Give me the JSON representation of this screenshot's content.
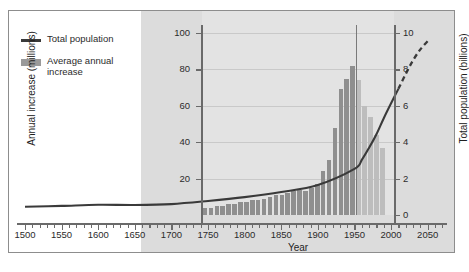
{
  "chart_data": {
    "type": "bar",
    "title": "",
    "xlabel": "Year",
    "ylabel": "Annual increase (millions)",
    "y2label": "Total population (billions)",
    "xlim": [
      1500,
      2075
    ],
    "ylim": [
      0,
      100
    ],
    "y2lim": [
      0,
      10
    ],
    "grid": true,
    "legend_position": "top-left",
    "legend": [
      {
        "label": "Total population",
        "marker": "line",
        "color": "#3a3a3a"
      },
      {
        "label": "Average annual\nincrease",
        "marker": "bar",
        "color": "#9a9a9a"
      }
    ],
    "xticks": [
      1500,
      1550,
      1600,
      1650,
      1700,
      1750,
      1800,
      1850,
      1900,
      1950,
      2000,
      2050
    ],
    "xticks_minor_step": 10,
    "yticks_left": [
      20,
      40,
      60,
      80,
      100
    ],
    "yticks_right": [
      0,
      2,
      4,
      6,
      8,
      10
    ],
    "annotations": [
      {
        "type": "vline",
        "x": 2010,
        "label": "present-day divider",
        "color": "#7a7a7a"
      },
      {
        "type": "shaded-region",
        "x_start": 1677,
        "x_end": 2075,
        "color": "#dcdcdc"
      },
      {
        "type": "dashed-line-segment",
        "x_start": 2010,
        "x_end": 2050,
        "label": "projected total population"
      }
    ],
    "series": [
      {
        "name": "Average annual increase",
        "type": "bar",
        "unit": "millions",
        "axis": "left",
        "bar_width_years": 10,
        "x": [
          1750,
          1760,
          1770,
          1780,
          1790,
          1800,
          1810,
          1820,
          1830,
          1840,
          1850,
          1860,
          1870,
          1880,
          1890,
          1900,
          1910,
          1920,
          1930,
          1940,
          1950,
          1960,
          1970,
          1980,
          1990,
          2000,
          2010,
          2020,
          2030,
          2040,
          2050
        ],
        "values": [
          4,
          4,
          5,
          5,
          6,
          6,
          7,
          7,
          8,
          8,
          9,
          10,
          11,
          11,
          12,
          13,
          14,
          13,
          15,
          17,
          24,
          30,
          48,
          69,
          75,
          82,
          74,
          60,
          54,
          44,
          37
        ],
        "projected_from": 2010
      },
      {
        "name": "Total population",
        "type": "line",
        "unit": "billions",
        "axis": "right",
        "x": [
          1500,
          1550,
          1600,
          1650,
          1700,
          1750,
          1800,
          1850,
          1900,
          1950,
          1960,
          1970,
          1980,
          1990,
          2000,
          2010,
          2020,
          2030,
          2040,
          2050
        ],
        "values": [
          0.45,
          0.5,
          0.56,
          0.55,
          0.6,
          0.77,
          0.98,
          1.26,
          1.65,
          2.53,
          3.03,
          3.7,
          4.44,
          5.32,
          6.14,
          6.93,
          7.75,
          8.5,
          9.1,
          9.55
        ],
        "projected_from": 2010
      }
    ]
  },
  "axes": {
    "left_title": "Annual increase (millions)",
    "right_title": "Total population (billions)",
    "x_title": "Year",
    "left_ticks": [
      "100",
      "80",
      "60",
      "40",
      "20"
    ],
    "right_ticks": [
      "10",
      "8",
      "6",
      "4",
      "2",
      "0"
    ],
    "x_ticks": [
      "1500",
      "1550",
      "1600",
      "1650",
      "1700",
      "1750",
      "1800",
      "1850",
      "1900",
      "1950",
      "2000",
      "2050"
    ]
  },
  "legend": {
    "line_label": "Total population",
    "bar_label_line1": "Average annual",
    "bar_label_line2": "increase"
  },
  "colors": {
    "bar": "#8f8f8f",
    "bar_projected": "#bdbdbd",
    "line": "#3a3a3a",
    "shade": "#dcdcdc",
    "grid": "#c9c9c9",
    "axis": "#6a6a6a",
    "frame": "#8d8d8d"
  }
}
